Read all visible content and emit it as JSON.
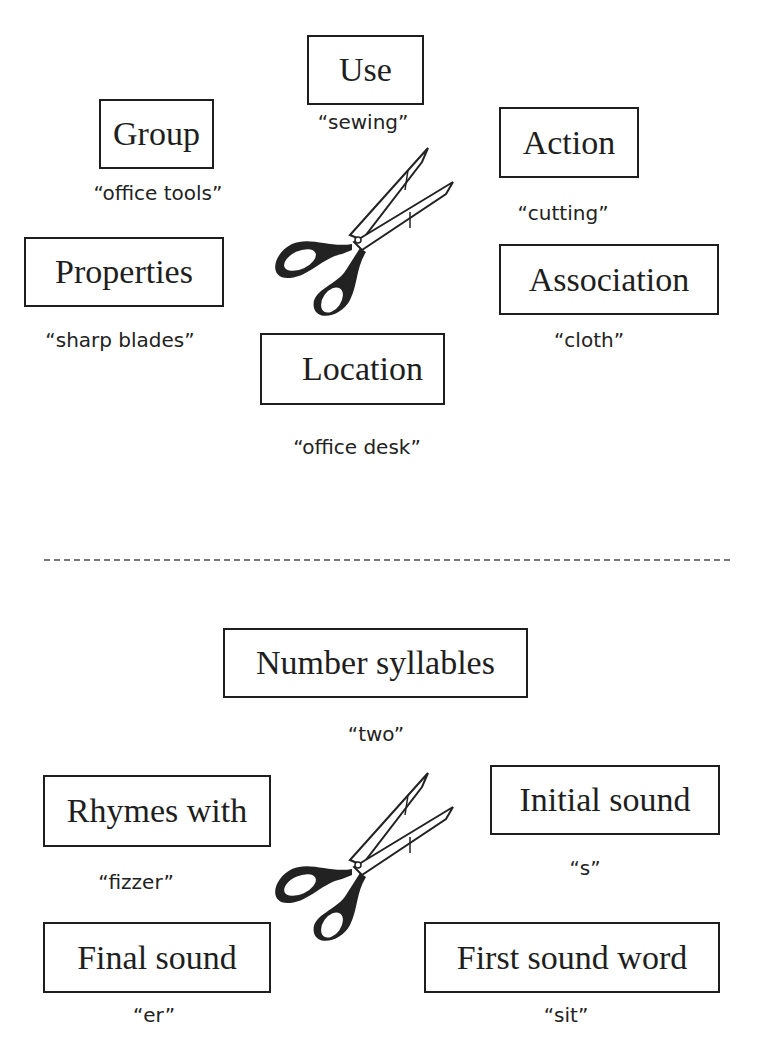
{
  "semantic_features": {
    "boxes": [
      {
        "label": "Use",
        "cue": "“sewing”"
      },
      {
        "label": "Group",
        "cue": "“office tools”"
      },
      {
        "label": "Action",
        "cue": "“cutting”"
      },
      {
        "label": "Properties",
        "cue": "“sharp blades”"
      },
      {
        "label": "Association",
        "cue": "“cloth”"
      },
      {
        "label": "Location",
        "cue": "“office desk”"
      }
    ],
    "image": "scissors-icon"
  },
  "phonological_features": {
    "boxes": [
      {
        "label": "Number syllables",
        "cue": "“two”"
      },
      {
        "label": "Rhymes with",
        "cue": "“fizzer”"
      },
      {
        "label": "Initial sound",
        "cue": "“s”"
      },
      {
        "label": "Final sound",
        "cue": "“er”"
      },
      {
        "label": "First sound word",
        "cue": "“sit”"
      }
    ],
    "image": "scissors-icon"
  },
  "colors": {
    "border": "#1e1e1e",
    "divider": "#777777",
    "background": "#ffffff"
  }
}
